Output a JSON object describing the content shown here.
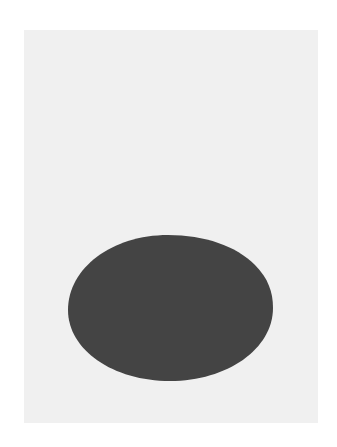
{
  "artwork": {
    "description": "Dark gray oval on light gray panel",
    "colors": {
      "surround": "#ffffff",
      "panel": "#f0f0f0",
      "oval": "#444444"
    },
    "panel": {
      "x": 24,
      "y": 30,
      "width": 294,
      "height": 393
    },
    "oval": {
      "cx": 170,
      "cy": 308,
      "rx": 103,
      "ry": 73
    }
  }
}
